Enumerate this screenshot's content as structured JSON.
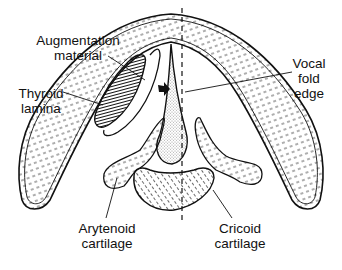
{
  "diagram": {
    "labels": {
      "augmentation": [
        "Augmentation",
        "material"
      ],
      "thyroid": [
        "Thyroid",
        "lamina"
      ],
      "vocal_fold": [
        "Vocal",
        "fold",
        "edge"
      ],
      "arytenoid": [
        "Arytenoid",
        "cartilage"
      ],
      "cricoid": [
        "Cricoid",
        "cartilage"
      ]
    },
    "colors": {
      "ink": "#111111",
      "background": "#ffffff"
    }
  }
}
